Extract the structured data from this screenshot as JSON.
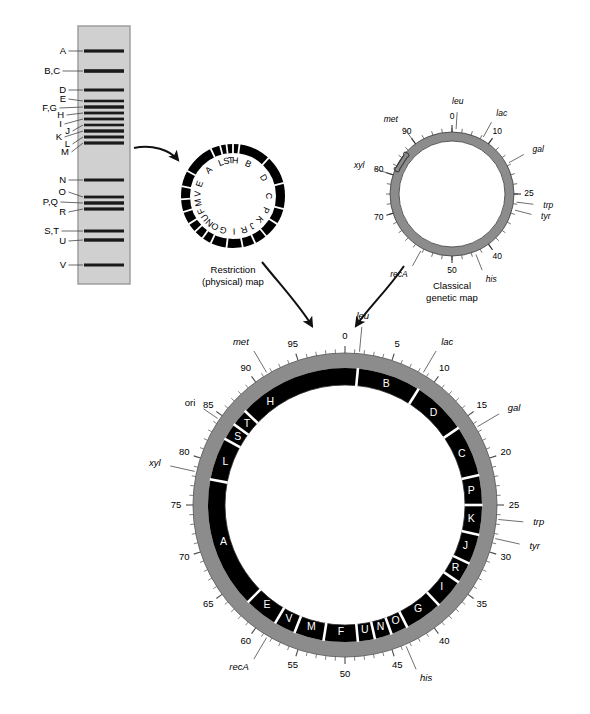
{
  "figure": {
    "kind": "genome-mapping-diagram",
    "colors": {
      "gel_background": "#d0d0d0",
      "gel_border": "#9a9a9a",
      "band": "#1a1a1a",
      "ring_black": "#000000",
      "ring_gray": "#8c8c8c",
      "ring_gray_dark": "#6f6f6f",
      "leader": "#555555",
      "arrow": "#111111",
      "paper": "#ffffff"
    }
  },
  "gel": {
    "name": "restriction-digest-gel",
    "lane_x": 78,
    "lane_y": 26,
    "lane_w": 52,
    "lane_h": 258,
    "bands": [
      {
        "label": "A",
        "y": 51,
        "thick": 3.2
      },
      {
        "label": "B,C",
        "y": 71,
        "thick": 3.6
      },
      {
        "label": "D",
        "y": 90,
        "thick": 3.0
      },
      {
        "label": "E",
        "y": 101,
        "thick": 2.6
      },
      {
        "label": "F,G",
        "y": 107,
        "thick": 3.4
      },
      {
        "label": "H",
        "y": 113,
        "thick": 2.8
      },
      {
        "label": "I",
        "y": 119,
        "thick": 2.8
      },
      {
        "label": "J",
        "y": 125,
        "thick": 2.6
      },
      {
        "label": "K",
        "y": 131,
        "thick": 3.4
      },
      {
        "label": "L",
        "y": 137,
        "thick": 3.0
      },
      {
        "label": "M",
        "y": 143,
        "thick": 3.2
      },
      {
        "label": "N",
        "y": 180,
        "thick": 3.0
      },
      {
        "label": "O",
        "y": 197,
        "thick": 2.8
      },
      {
        "label": "P,Q",
        "y": 203,
        "thick": 3.4
      },
      {
        "label": "R",
        "y": 209,
        "thick": 3.2
      },
      {
        "label": "S,T",
        "y": 231,
        "thick": 3.0
      },
      {
        "label": "U",
        "y": 240,
        "thick": 3.4
      },
      {
        "label": "V",
        "y": 265,
        "thick": 3.0
      }
    ],
    "labels": [
      {
        "text": "A",
        "x": 66,
        "y": 51,
        "leader_to_y": 51
      },
      {
        "text": "B,C",
        "x": 60,
        "y": 71,
        "leader_to_y": 71
      },
      {
        "text": "D",
        "x": 66,
        "y": 90,
        "leader_to_y": 90
      },
      {
        "text": "E",
        "x": 66,
        "y": 99,
        "leader_to_y": 101
      },
      {
        "text": "F,G",
        "x": 57,
        "y": 108,
        "leader_to_y": 107
      },
      {
        "text": "H",
        "x": 64,
        "y": 115,
        "leader_to_y": 113
      },
      {
        "text": "I",
        "x": 62,
        "y": 124,
        "leader_to_y": 119
      },
      {
        "text": "J",
        "x": 70,
        "y": 131,
        "leader_to_y": 125
      },
      {
        "text": "K",
        "x": 62,
        "y": 137,
        "leader_to_y": 131
      },
      {
        "text": "L",
        "x": 70,
        "y": 144,
        "leader_to_y": 137
      },
      {
        "text": "M",
        "x": 69,
        "y": 152,
        "leader_to_y": 143
      },
      {
        "text": "N",
        "x": 66,
        "y": 180,
        "leader_to_y": 180
      },
      {
        "text": "O",
        "x": 66,
        "y": 192,
        "leader_to_y": 197
      },
      {
        "text": "P,Q",
        "x": 58,
        "y": 202,
        "leader_to_y": 203
      },
      {
        "text": "R",
        "x": 66,
        "y": 212,
        "leader_to_y": 209
      },
      {
        "text": "S,T",
        "x": 59,
        "y": 231,
        "leader_to_y": 231
      },
      {
        "text": "U",
        "x": 66,
        "y": 241,
        "leader_to_y": 240
      },
      {
        "text": "V",
        "x": 66,
        "y": 265,
        "leader_to_y": 265
      }
    ]
  },
  "restriction_map": {
    "name": "restriction-physical-map",
    "caption_line1": "Restriction",
    "caption_line2": "(physical) map",
    "cx": 233,
    "cy": 196,
    "r_outer": 52,
    "ring_w": 9,
    "fragments": [
      {
        "label": "B",
        "start": 2,
        "end": 12
      },
      {
        "label": "D",
        "start": 12,
        "end": 21
      },
      {
        "label": "C",
        "start": 21,
        "end": 29
      },
      {
        "label": "P",
        "start": 29,
        "end": 34
      },
      {
        "label": "K",
        "start": 34,
        "end": 39
      },
      {
        "label": "J",
        "start": 39,
        "end": 43
      },
      {
        "label": "R",
        "start": 43,
        "end": 47
      },
      {
        "label": "I",
        "start": 47,
        "end": 52
      },
      {
        "label": "G",
        "start": 52,
        "end": 57
      },
      {
        "label": "O",
        "start": 57,
        "end": 60
      },
      {
        "label": "N",
        "start": 60,
        "end": 63
      },
      {
        "label": "U",
        "start": 63,
        "end": 66
      },
      {
        "label": "F",
        "start": 66,
        "end": 70
      },
      {
        "label": "M",
        "start": 70,
        "end": 74
      },
      {
        "label": "V",
        "start": 74,
        "end": 78
      },
      {
        "label": "E",
        "start": 78,
        "end": 83
      },
      {
        "label": "A",
        "start": 83,
        "end": 93
      },
      {
        "label": "L",
        "start": 93,
        "end": 96
      },
      {
        "label": "S",
        "start": 96,
        "end": 98
      },
      {
        "label": "T",
        "start": 98,
        "end": 100
      },
      {
        "label": "H",
        "start": 0,
        "end": 2
      }
    ]
  },
  "genetic_map": {
    "name": "classical-genetic-map",
    "caption_line1": "Classical",
    "caption_line2": "genetic map",
    "cx": 452,
    "cy": 194,
    "r_outer": 62,
    "ring_w": 9,
    "major_ticks": [
      {
        "value": "0",
        "pos": 0
      },
      {
        "value": "10",
        "pos": 10
      },
      {
        "value": "25",
        "pos": 25
      },
      {
        "value": "40",
        "pos": 40
      },
      {
        "value": "50",
        "pos": 50
      },
      {
        "value": "70",
        "pos": 70
      },
      {
        "value": "80",
        "pos": 80
      },
      {
        "value": "90",
        "pos": 90
      }
    ],
    "genes": [
      {
        "name": "leu",
        "pos": 1
      },
      {
        "name": "lac",
        "pos": 8
      },
      {
        "name": "gal",
        "pos": 17
      },
      {
        "name": "trp",
        "pos": 27
      },
      {
        "name": "tyr",
        "pos": 29
      },
      {
        "name": "his",
        "pos": 44
      },
      {
        "name": "recA",
        "pos": 58
      },
      {
        "name": "xyl",
        "pos": 80
      },
      {
        "name": "met",
        "pos": 90
      }
    ],
    "ori_label": "",
    "ori_pos": 84
  },
  "integrated_map": {
    "name": "integrated-genome-map",
    "cx": 345,
    "cy": 505,
    "r_outer": 152,
    "gray_w": 15,
    "black_w": 17,
    "scale_ticks": [
      {
        "value": "0",
        "pos": 0
      },
      {
        "value": "5",
        "pos": 5
      },
      {
        "value": "10",
        "pos": 10
      },
      {
        "value": "15",
        "pos": 15
      },
      {
        "value": "20",
        "pos": 20
      },
      {
        "value": "25",
        "pos": 25
      },
      {
        "value": "30",
        "pos": 30
      },
      {
        "value": "35",
        "pos": 35
      },
      {
        "value": "40",
        "pos": 40
      },
      {
        "value": "45",
        "pos": 45
      },
      {
        "value": "50",
        "pos": 50
      },
      {
        "value": "55",
        "pos": 55
      },
      {
        "value": "60",
        "pos": 60
      },
      {
        "value": "65",
        "pos": 65
      },
      {
        "value": "70",
        "pos": 70
      },
      {
        "value": "75",
        "pos": 75
      },
      {
        "value": "80",
        "pos": 80
      },
      {
        "value": "85",
        "pos": 85
      },
      {
        "value": "90",
        "pos": 90
      },
      {
        "value": "95",
        "pos": 95
      }
    ],
    "genes": [
      {
        "name": "leu",
        "pos": 1.5
      },
      {
        "name": "lac",
        "pos": 8.5
      },
      {
        "name": "gal",
        "pos": 16.5
      },
      {
        "name": "trp",
        "pos": 26.5
      },
      {
        "name": "tyr",
        "pos": 28.5
      },
      {
        "name": "his",
        "pos": 43.5
      },
      {
        "name": "recA",
        "pos": 58.5
      },
      {
        "name": "xyl",
        "pos": 78.5
      },
      {
        "name": "met",
        "pos": 91.5
      },
      {
        "name": "ori",
        "pos": 84.5
      }
    ],
    "fragments": [
      {
        "label": "B",
        "start": 1.5,
        "end": 9.0
      },
      {
        "label": "D",
        "start": 9.0,
        "end": 15.5
      },
      {
        "label": "C",
        "start": 15.5,
        "end": 21.5
      },
      {
        "label": "P",
        "start": 21.5,
        "end": 25.0
      },
      {
        "label": "K",
        "start": 25.0,
        "end": 28.5
      },
      {
        "label": "J",
        "start": 28.5,
        "end": 32.0
      },
      {
        "label": "R",
        "start": 32.0,
        "end": 34.5
      },
      {
        "label": "I",
        "start": 34.5,
        "end": 38.0
      },
      {
        "label": "G",
        "start": 38.0,
        "end": 42.5
      },
      {
        "label": "O",
        "start": 42.5,
        "end": 44.5
      },
      {
        "label": "N",
        "start": 44.5,
        "end": 46.5
      },
      {
        "label": "U",
        "start": 46.5,
        "end": 48.5
      },
      {
        "label": "F",
        "start": 48.5,
        "end": 52.5
      },
      {
        "label": "M",
        "start": 52.5,
        "end": 56.0
      },
      {
        "label": "V",
        "start": 56.0,
        "end": 58.5
      },
      {
        "label": "E",
        "start": 58.5,
        "end": 62.5
      },
      {
        "label": "A",
        "start": 62.5,
        "end": 78.0
      },
      {
        "label": "L",
        "start": 78.0,
        "end": 83.0
      },
      {
        "label": "S",
        "start": 83.0,
        "end": 85.0
      },
      {
        "label": "T",
        "start": 85.0,
        "end": 87.0
      },
      {
        "label": "H",
        "start": 87.0,
        "end": 93.0
      }
    ]
  }
}
